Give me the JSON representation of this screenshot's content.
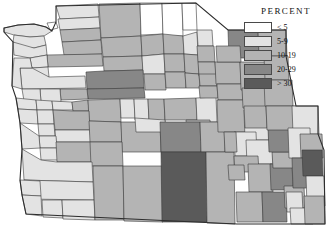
{
  "legend": {
    "title": "PERCENT",
    "entries": [
      {
        "label": "< 5",
        "color": "#ffffff"
      },
      {
        "label": "5-9",
        "color": "#e3e3e3"
      },
      {
        "label": "10-19",
        "color": "#b4b4b4"
      },
      {
        "label": "20-29",
        "color": "#878787"
      },
      {
        "label": "> 30",
        "color": "#5a5a5a"
      }
    ]
  },
  "map": {
    "background": "#ffffff",
    "stroke": "#3a3a3a",
    "chart_data": {
      "type": "choropleth",
      "title": "PERCENT",
      "classes": [
        "< 5",
        "5-9",
        "10-19",
        "20-29",
        "> 30"
      ],
      "class_colors": [
        "#ffffff",
        "#e3e3e3",
        "#b4b4b4",
        "#878787",
        "#5a5a5a"
      ],
      "region": "Pacific Northwest counties (WA, OR, ID, western MT, WY)",
      "units": "percent",
      "regions": [
        {
          "id": "wa-clallam",
          "class": 1,
          "d": "M4,28 L18,25 L34,24 L46,27 L52,31 L44,36 L30,37 L14,35 L4,32 Z"
        },
        {
          "id": "wa-jefferson",
          "class": 1,
          "d": "M14,35 L30,37 L44,36 L46,45 L34,48 L20,47 L13,42 Z"
        },
        {
          "id": "wa-island",
          "class": 0,
          "d": "M47,23 L56,22 L58,28 L50,30 Z"
        },
        {
          "id": "wa-whatcom",
          "class": 1,
          "d": "M56,6 L98,4 L99,17 L60,19 Z"
        },
        {
          "id": "wa-skagit",
          "class": 1,
          "d": "M58,19 L99,17 L100,28 L60,30 Z"
        },
        {
          "id": "wa-snohomish",
          "class": 2,
          "d": "M60,30 L100,28 L101,40 L62,42 Z"
        },
        {
          "id": "wa-king",
          "class": 2,
          "d": "M62,42 L101,40 L102,54 L64,55 Z"
        },
        {
          "id": "wa-pierce",
          "class": 2,
          "d": "M47,55 L102,54 L103,66 L48,67 Z"
        },
        {
          "id": "wa-grays",
          "class": 1,
          "d": "M13,42 L34,48 L46,45 L47,55 L30,58 L14,55 Z"
        },
        {
          "id": "wa-mason",
          "class": 1,
          "d": "M30,58 L47,55 L48,67 L32,68 Z"
        },
        {
          "id": "wa-thurston",
          "class": 1,
          "d": "M32,68 L48,67 L49,77 L33,78 Z"
        },
        {
          "id": "wa-lewis",
          "class": 1,
          "d": "M20,68 L32,68 L49,77 L85,76 L86,88 L22,89 Z"
        },
        {
          "id": "wa-okanogan",
          "class": 2,
          "d": "M99,4 L140,3 L141,36 L101,38 Z"
        },
        {
          "id": "wa-ferry",
          "class": 0,
          "d": "M140,3 L162,3 L163,34 L141,35 Z"
        },
        {
          "id": "wa-stevens",
          "class": 0,
          "d": "M162,3 L182,3 L183,36 L163,36 Z"
        },
        {
          "id": "wa-pendoreille",
          "class": 0,
          "d": "M182,3 L196,3 L197,30 L183,30 Z"
        },
        {
          "id": "wa-chelan",
          "class": 2,
          "d": "M101,38 L141,36 L142,56 L103,57 Z"
        },
        {
          "id": "wa-douglas",
          "class": 2,
          "d": "M141,36 L163,34 L164,54 L142,56 Z"
        },
        {
          "id": "wa-lincoln",
          "class": 2,
          "d": "M163,34 L183,36 L184,54 L164,54 Z"
        },
        {
          "id": "wa-spokane",
          "class": 1,
          "d": "M183,36 L197,32 L198,55 L184,54 Z"
        },
        {
          "id": "wa-kittitas",
          "class": 2,
          "d": "M103,57 L142,56 L143,70 L104,71 Z"
        },
        {
          "id": "wa-grant",
          "class": 1,
          "d": "M142,56 L164,54 L165,74 L143,74 Z"
        },
        {
          "id": "wa-adams",
          "class": 2,
          "d": "M164,54 L184,54 L185,72 L165,72 Z"
        },
        {
          "id": "wa-whitman",
          "class": 2,
          "d": "M184,54 L198,55 L199,74 L185,73 Z"
        },
        {
          "id": "wa-yakima",
          "class": 3,
          "d": "M86,72 L104,71 L143,70 L144,88 L87,89 Z"
        },
        {
          "id": "wa-benton",
          "class": 2,
          "d": "M144,74 L165,74 L166,90 L145,90 Z"
        },
        {
          "id": "wa-franklin",
          "class": 2,
          "d": "M165,72 L185,72 L186,88 L166,88 Z"
        },
        {
          "id": "wa-walla",
          "class": 2,
          "d": "M185,73 L199,74 L200,88 L186,88 Z"
        },
        {
          "id": "wa-klickitat",
          "class": 3,
          "d": "M87,89 L144,88 L145,98 L88,99 Z"
        },
        {
          "id": "wa-skamania",
          "class": 2,
          "d": "M60,89 L87,89 L88,99 L61,100 Z"
        },
        {
          "id": "wa-clark",
          "class": 1,
          "d": "M40,89 L60,89 L61,102 L41,102 Z"
        },
        {
          "id": "wa-cowlitz",
          "class": 1,
          "d": "M22,89 L40,89 L41,102 L24,101 Z"
        },
        {
          "id": "wa-pacific",
          "class": 1,
          "d": "M14,58 L30,58 L32,68 L20,68 L22,89 L12,86 Z"
        },
        {
          "id": "or-clatsop",
          "class": 1,
          "d": "M16,98 L36,100 L37,110 L18,109 Z"
        },
        {
          "id": "or-columbia",
          "class": 1,
          "d": "M36,100 L52,101 L53,110 L37,110 Z"
        },
        {
          "id": "or-multnomah",
          "class": 1,
          "d": "M52,101 L72,102 L73,110 L53,110 Z"
        },
        {
          "id": "or-hoodriver",
          "class": 2,
          "d": "M72,102 L88,100 L89,111 L73,111 Z"
        },
        {
          "id": "or-wasco",
          "class": 2,
          "d": "M88,100 L120,99 L121,122 L89,121 Z"
        },
        {
          "id": "or-sherman",
          "class": 1,
          "d": "M120,99 L134,99 L135,118 L121,118 Z"
        },
        {
          "id": "or-gilliam",
          "class": 1,
          "d": "M134,99 L148,99 L149,120 L135,120 Z"
        },
        {
          "id": "or-morrow",
          "class": 2,
          "d": "M148,99 L164,99 L165,122 L149,122 Z"
        },
        {
          "id": "or-umatilla",
          "class": 2,
          "d": "M164,99 L196,98 L197,120 L165,120 Z"
        },
        {
          "id": "or-wallowa",
          "class": 1,
          "d": "M196,98 L216,97 L217,122 L197,122 Z"
        },
        {
          "id": "or-union",
          "class": 2,
          "d": "M186,120 L210,120 L211,140 L187,140 Z"
        },
        {
          "id": "or-tillamook",
          "class": 1,
          "d": "M18,109 L37,110 L38,124 L20,123 Z"
        },
        {
          "id": "or-washington",
          "class": 1,
          "d": "M37,110 L53,110 L54,124 L38,124 Z"
        },
        {
          "id": "or-yamhill",
          "class": 1,
          "d": "M38,124 L54,124 L55,136 L39,136 Z"
        },
        {
          "id": "or-clackamas",
          "class": 2,
          "d": "M53,110 L73,111 L89,111 L90,130 L55,130 Z"
        },
        {
          "id": "or-marion",
          "class": 1,
          "d": "M55,130 L90,130 L91,142 L56,142 Z"
        },
        {
          "id": "or-polk",
          "class": 1,
          "d": "M39,136 L56,136 L57,148 L40,148 Z"
        },
        {
          "id": "or-lincoln",
          "class": 1,
          "d": "M20,123 L39,136 L40,148 L22,149 Z"
        },
        {
          "id": "or-benton",
          "class": 1,
          "d": "M40,148 L57,148 L58,160 L41,160 Z"
        },
        {
          "id": "or-linn",
          "class": 2,
          "d": "M56,142 L91,142 L92,162 L57,162 Z"
        },
        {
          "id": "or-jefferson",
          "class": 2,
          "d": "M89,121 L121,122 L122,142 L90,142 Z"
        },
        {
          "id": "or-crook",
          "class": 2,
          "d": "M121,122 L160,122 L161,152 L122,152 Z"
        },
        {
          "id": "or-wheeler",
          "class": 1,
          "d": "M135,118 L165,120 L166,132 L136,132 Z"
        },
        {
          "id": "or-grant",
          "class": 3,
          "d": "M160,122 L200,122 L201,152 L161,152 Z"
        },
        {
          "id": "or-baker",
          "class": 2,
          "d": "M200,122 L224,122 L225,152 L201,152 Z"
        },
        {
          "id": "or-deschutes",
          "class": 2,
          "d": "M90,142 L122,142 L123,166 L91,166 Z"
        },
        {
          "id": "or-lane",
          "class": 1,
          "d": "M22,149 L41,160 L57,162 L92,162 L93,182 L24,180 Z"
        },
        {
          "id": "or-douglas",
          "class": 1,
          "d": "M24,180 L93,182 L94,200 L26,199 Z"
        },
        {
          "id": "or-coos",
          "class": 1,
          "d": "M20,180 L40,181 L41,196 L22,195 Z"
        },
        {
          "id": "or-curry",
          "class": 1,
          "d": "M22,195 L41,196 L42,216 L26,214 Z"
        },
        {
          "id": "or-josephine",
          "class": 1,
          "d": "M42,200 L62,200 L63,218 L43,217 Z"
        },
        {
          "id": "or-jackson",
          "class": 1,
          "d": "M62,200 L94,200 L95,220 L63,219 Z"
        },
        {
          "id": "or-klamath",
          "class": 2,
          "d": "M93,166 L123,166 L124,220 L95,220 Z"
        },
        {
          "id": "or-lake",
          "class": 2,
          "d": "M123,166 L162,166 L163,222 L124,221 Z"
        },
        {
          "id": "or-harney",
          "class": 4,
          "d": "M161,152 L206,152 L207,222 L162,222 Z"
        },
        {
          "id": "or-malheur",
          "class": 2,
          "d": "M206,152 L234,152 L235,224 L207,223 Z"
        },
        {
          "id": "id-boundary",
          "class": 1,
          "d": "M197,30 L212,30 L213,46 L198,46 Z"
        },
        {
          "id": "id-bonner",
          "class": 2,
          "d": "M197,46 L214,46 L215,62 L198,62 Z"
        },
        {
          "id": "id-kootenai",
          "class": 2,
          "d": "M198,62 L215,62 L216,76 L199,76 Z"
        },
        {
          "id": "id-benewah",
          "class": 2,
          "d": "M199,74 L216,74 L217,86 L200,86 Z"
        },
        {
          "id": "id-latah",
          "class": 2,
          "d": "M199,86 L217,86 L218,98 L200,98 Z"
        },
        {
          "id": "id-shoshone",
          "class": 2,
          "d": "M215,62 L240,62 L241,84 L216,84 Z"
        },
        {
          "id": "id-clearwater",
          "class": 2,
          "d": "M217,84 L242,84 L243,100 L218,100 Z"
        },
        {
          "id": "id-idaho",
          "class": 2,
          "d": "M217,100 L252,100 L253,132 L218,132 Z"
        },
        {
          "id": "id-lemhi",
          "class": 1,
          "d": "M244,110 L268,110 L269,140 L245,140 Z"
        },
        {
          "id": "id-valley",
          "class": 1,
          "d": "M234,132 L256,132 L257,156 L235,156 Z"
        },
        {
          "id": "id-adams",
          "class": 2,
          "d": "M224,132 L236,132 L237,152 L225,152 Z"
        },
        {
          "id": "id-custer",
          "class": 1,
          "d": "M246,140 L272,140 L273,164 L247,164 Z"
        },
        {
          "id": "id-boise",
          "class": 2,
          "d": "M234,156 L258,156 L259,172 L235,172 Z"
        },
        {
          "id": "id-ada",
          "class": 2,
          "d": "M228,165 L244,165 L245,180 L229,180 Z"
        },
        {
          "id": "id-blaine",
          "class": 2,
          "d": "M248,164 L272,164 L273,192 L249,192 Z"
        },
        {
          "id": "id-twinfalls",
          "class": 2,
          "d": "M236,192 L262,192 L263,222 L237,222 Z"
        },
        {
          "id": "id-cassia",
          "class": 3,
          "d": "M262,192 L286,192 L287,222 L263,222 Z"
        },
        {
          "id": "id-bingham",
          "class": 3,
          "d": "M270,164 L292,164 L293,190 L271,190 Z"
        },
        {
          "id": "id-bonneville",
          "class": 2,
          "d": "M272,152 L294,152 L295,168 L273,168 Z"
        },
        {
          "id": "id-fremont",
          "class": 3,
          "d": "M268,128 L292,128 L293,152 L269,152 Z"
        },
        {
          "id": "id-power",
          "class": 2,
          "d": "M284,186 L304,186 L305,208 L285,208 Z"
        },
        {
          "id": "id-bannock",
          "class": 1,
          "d": "M286,192 L302,192 L303,212 L287,212 Z"
        },
        {
          "id": "id-franklin",
          "class": 1,
          "d": "M290,208 L312,208 L313,224 L291,224 Z"
        },
        {
          "id": "mt-flathead",
          "class": 2,
          "d": "M240,62 L266,62 L267,90 L241,90 Z"
        },
        {
          "id": "mt-lincoln",
          "class": 3,
          "d": "M228,30 L258,30 L259,58 L229,58 Z"
        },
        {
          "id": "mt-sanders",
          "class": 2,
          "d": "M216,46 L240,46 L241,62 L217,62 Z"
        },
        {
          "id": "mt-missoula",
          "class": 2,
          "d": "M242,88 L266,88 L267,108 L243,108 Z"
        },
        {
          "id": "mt-ravalli",
          "class": 2,
          "d": "M244,106 L266,106 L267,128 L245,128 Z"
        },
        {
          "id": "mt-glacier",
          "class": 2,
          "d": "M258,30 L286,30 L287,56 L259,56 Z"
        },
        {
          "id": "mt-lake",
          "class": 2,
          "d": "M264,56 L288,56 L289,80 L265,80 Z"
        },
        {
          "id": "mt-powell",
          "class": 2,
          "d": "M264,80 L292,80 L293,106 L265,106 Z"
        },
        {
          "id": "mt-beaverhead",
          "class": 2,
          "d": "M266,106 L296,106 L297,130 L267,130 Z"
        },
        {
          "id": "wy-park",
          "class": 1,
          "d": "M292,106 L318,106 L319,134 L293,134 Z"
        },
        {
          "id": "wy-teton",
          "class": 1,
          "d": "M288,128 L310,128 L311,158 L289,158 Z"
        },
        {
          "id": "wy-bighorn",
          "class": 2,
          "d": "M300,134 L322,134 L323,158 L301,158 Z"
        },
        {
          "id": "wy-fremont",
          "class": 3,
          "d": "M292,158 L318,158 L319,188 L293,188 Z"
        },
        {
          "id": "wy-sublette",
          "class": 4,
          "d": "M302,150 L322,150 L323,176 L303,176 Z"
        },
        {
          "id": "wy-lincoln",
          "class": 1,
          "d": "M306,176 L324,176 L325,206 L307,206 Z"
        },
        {
          "id": "wy-sweetwater",
          "class": 2,
          "d": "M304,196 L324,196 L325,224 L305,224 Z"
        }
      ]
    }
  }
}
